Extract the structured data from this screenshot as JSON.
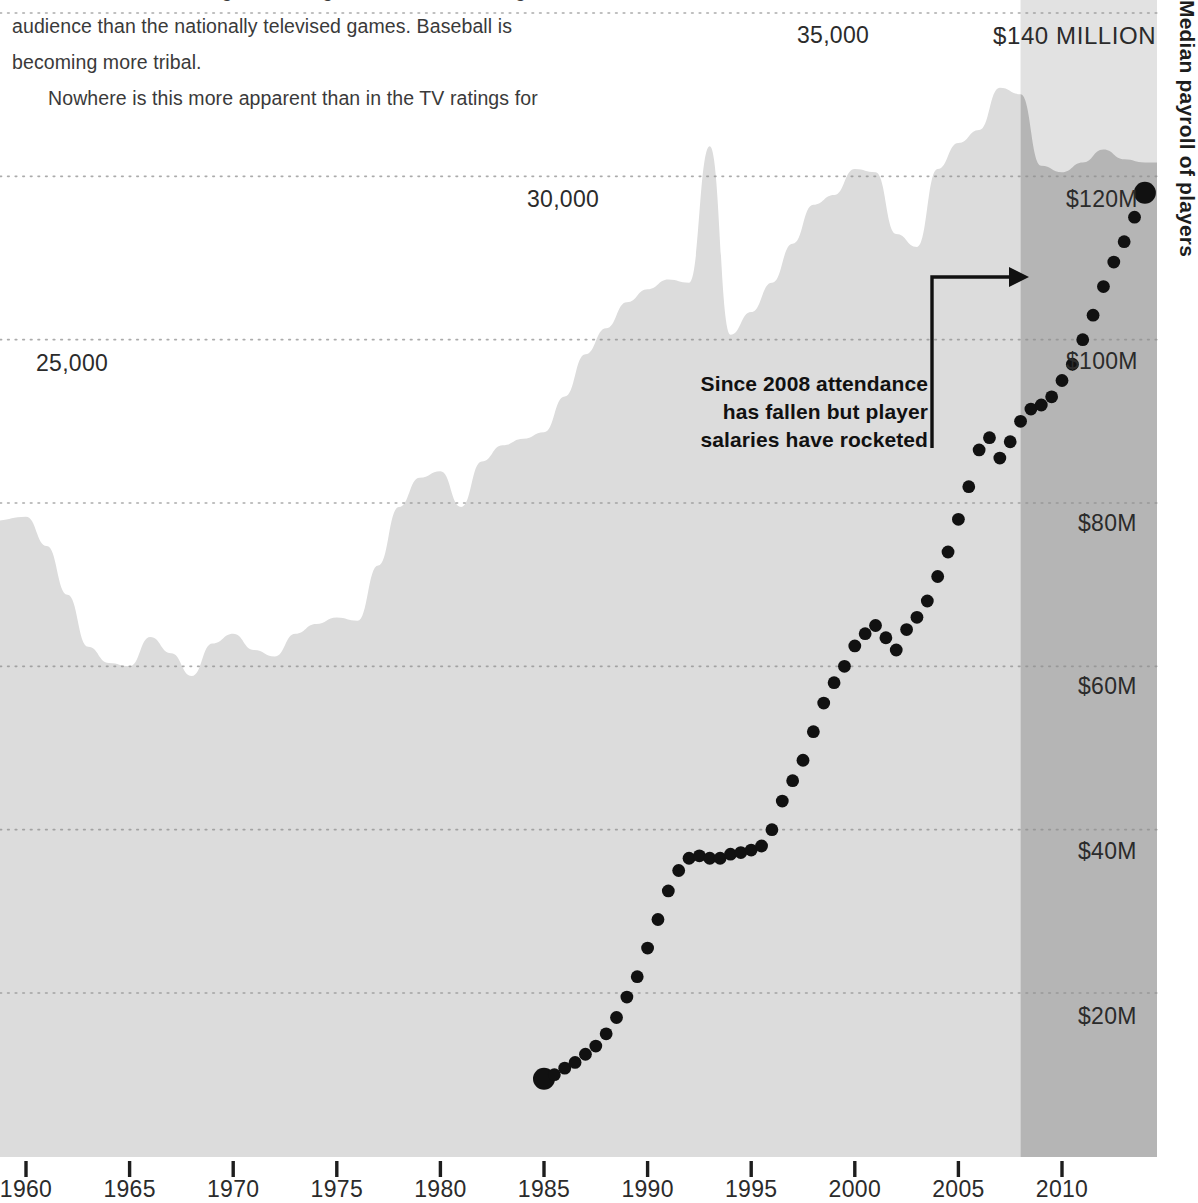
{
  "article": {
    "lines": [
      "the US where local ratings for MLB games now have a larger",
      "audience than the nationally televised games. Baseball is",
      "becoming more tribal.",
      "Nowhere is this more apparent than in the TV ratings for"
    ]
  },
  "right_title": "Median payroll of players",
  "annotation": {
    "line1": "Since 2008 attendance",
    "line2": "has fallen but player",
    "line3": "salaries have rocketed"
  },
  "chart_data": {
    "type": "area",
    "title": "",
    "xlabel": "",
    "ylabel": "",
    "grid": true,
    "legend_position": "none",
    "x_axis": {
      "ticks": [
        1960,
        1965,
        1970,
        1975,
        1980,
        1985,
        1990,
        1995,
        2000,
        2005,
        2010
      ],
      "tick_labels": [
        "1960",
        "1965",
        "1970",
        "1975",
        "1980",
        "1985",
        "1990",
        "1995",
        "2000",
        "2005",
        "2010"
      ],
      "range": [
        1959,
        1966
      ]
    },
    "left_axis": {
      "name": "Average attendance per game",
      "tick_labels": [
        "35,000",
        "30,000",
        "25,000"
      ],
      "tick_values": [
        35000,
        30000,
        25000
      ],
      "range": [
        7000,
        36000
      ],
      "gridlines": [
        35000,
        30000,
        25000,
        20000,
        15000,
        10000
      ]
    },
    "right_axis": {
      "name": "Median payroll of players",
      "tick_labels": [
        "$140 MILLION",
        "$120M",
        "$100M",
        "$80M",
        "$60M",
        "$40M",
        "$20M"
      ],
      "tick_values": [
        140,
        120,
        100,
        80,
        60,
        40,
        20
      ],
      "range": [
        0,
        145
      ],
      "unit": "US$ million"
    },
    "highlight_band": {
      "label": "2008 onwards",
      "from": 2008,
      "to": 2014,
      "color": "#b3b3b3"
    },
    "series": [
      {
        "name": "Average attendance per game",
        "render": "area",
        "color": "#d9d9d9",
        "axis": "left",
        "x": [
          1960,
          1961,
          1962,
          1963,
          1964,
          1965,
          1966,
          1967,
          1968,
          1969,
          1970,
          1971,
          1972,
          1973,
          1974,
          1975,
          1976,
          1977,
          1978,
          1979,
          1980,
          1981,
          1982,
          1983,
          1984,
          1985,
          1986,
          1987,
          1988,
          1989,
          1990,
          1991,
          1992,
          1993,
          1994,
          1995,
          1996,
          1997,
          1998,
          1999,
          2000,
          2001,
          2002,
          2003,
          2004,
          2005,
          2006,
          2007,
          2008,
          2009,
          2010,
          2011,
          2012,
          2013,
          2014
        ],
        "values": [
          19500,
          18600,
          17100,
          15500,
          15000,
          14900,
          15800,
          15300,
          14600,
          15600,
          15900,
          15400,
          15200,
          15900,
          16200,
          16400,
          16300,
          18000,
          19800,
          20700,
          20900,
          19800,
          21200,
          21700,
          21900,
          22100,
          23200,
          24500,
          25300,
          26100,
          26500,
          26800,
          26700,
          30900,
          25100,
          25800,
          26700,
          27900,
          29100,
          29400,
          30200,
          30100,
          28200,
          27800,
          30200,
          31000,
          31400,
          32700,
          32500,
          30300,
          30100,
          30400,
          30800,
          30500,
          30400
        ]
      },
      {
        "name": "Median payroll of players",
        "render": "scatter-dots",
        "color": "#111111",
        "axis": "right",
        "x": [
          1985.0,
          1985.5,
          1986.0,
          1986.5,
          1987.0,
          1987.5,
          1988.0,
          1988.5,
          1989.0,
          1989.5,
          1990.0,
          1990.5,
          1991.0,
          1991.5,
          1992.0,
          1992.5,
          1993.0,
          1993.5,
          1994.0,
          1994.5,
          1995.0,
          1995.5,
          1996.0,
          1996.5,
          1997.0,
          1997.5,
          1998.0,
          1998.5,
          1999.0,
          1999.5,
          2000.0,
          2000.5,
          2001.0,
          2001.5,
          2002.0,
          2002.5,
          2003.0,
          2003.5,
          2004.0,
          2004.5,
          2005.0,
          2005.5,
          2006.0,
          2006.5,
          2007.0,
          2007.5,
          2008.0,
          2008.5,
          2009.0,
          2009.5,
          2010.0,
          2010.5,
          2011.0,
          2011.5,
          2012.0,
          2012.5,
          2013.0,
          2013.5,
          2014.0
        ],
        "values": [
          9.5,
          10.0,
          10.8,
          11.5,
          12.5,
          13.5,
          15.0,
          17.0,
          19.5,
          22.0,
          25.5,
          29.0,
          32.5,
          35.0,
          36.5,
          36.8,
          36.5,
          36.5,
          37.0,
          37.2,
          37.5,
          38.0,
          40.0,
          43.5,
          46.0,
          48.5,
          52.0,
          55.5,
          58.0,
          60.0,
          62.5,
          64.0,
          65.0,
          63.5,
          62.0,
          64.5,
          66.0,
          68.0,
          71.0,
          74.0,
          78.0,
          82.0,
          86.5,
          88.0,
          85.5,
          87.5,
          90.0,
          91.5,
          92.0,
          93.0,
          95.0,
          97.0,
          100.0,
          103.0,
          106.5,
          109.5,
          112.0,
          115.0,
          118.0
        ],
        "endpoint_markers": [
          {
            "x": 1985.0,
            "y": 9.5,
            "size": "large"
          },
          {
            "x": 2014.0,
            "y": 118.0,
            "size": "large"
          }
        ]
      }
    ],
    "annotations": [
      {
        "text": "Since 2008 attendance has fallen but player salaries have rocketed",
        "callout_from": [
          2005.2,
          122
        ],
        "callout_to": [
          2008.6,
          122
        ]
      }
    ]
  }
}
